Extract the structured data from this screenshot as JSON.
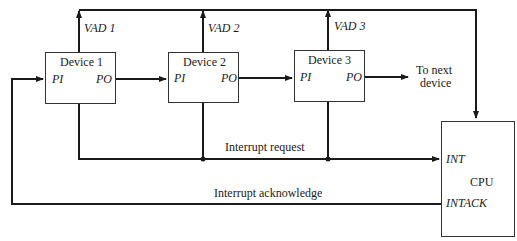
{
  "diagram": {
    "devices": [
      {
        "name": "Device 1",
        "pi": "PI",
        "po": "PO",
        "vad": "VAD 1"
      },
      {
        "name": "Device 2",
        "pi": "PI",
        "po": "PO",
        "vad": "VAD 2"
      },
      {
        "name": "Device 3",
        "pi": "PI",
        "po": "PO",
        "vad": "VAD 3"
      }
    ],
    "next_device": "To next device",
    "next_device_lines": [
      "To next",
      "device"
    ],
    "cpu": {
      "name": "CPU",
      "int": "INT",
      "intack": "INTACK"
    },
    "signals": {
      "interrupt_request": "Interrupt request",
      "interrupt_acknowledge": "Interrupt acknowledge"
    },
    "colors": {
      "line": "#1a1a1a",
      "background": "#ffffff"
    }
  }
}
